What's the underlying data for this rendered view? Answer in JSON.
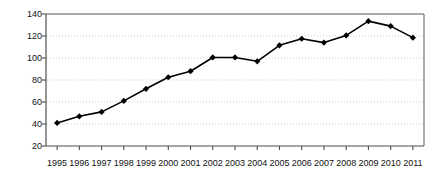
{
  "chart_data": {
    "type": "line",
    "title": "",
    "subtitle": "",
    "xlabel": "",
    "ylabel": "2002 = 100",
    "categories": [
      "1995",
      "1996",
      "1997",
      "1998",
      "1999",
      "2000",
      "2001",
      "2002",
      "2003",
      "2004",
      "2005",
      "2006",
      "2007",
      "2008",
      "2009",
      "2010",
      "2011"
    ],
    "values": [
      41,
      47,
      51,
      61,
      72,
      82.5,
      88,
      100.5,
      100.5,
      97,
      111.5,
      117.5,
      114,
      120.5,
      133.5,
      129,
      118.5
    ],
    "series": [
      {
        "name": "Index (2002 = 100)",
        "values": [
          41,
          47,
          51,
          61,
          72,
          82.5,
          88,
          100.5,
          100.5,
          97,
          111.5,
          117.5,
          114,
          120.5,
          133.5,
          129,
          118.5
        ]
      }
    ],
    "ylim": [
      20,
      140
    ],
    "yticks": [
      20,
      40,
      60,
      80,
      100,
      120,
      140
    ],
    "ytick_labels": [
      "20",
      "40",
      "60",
      "80",
      "100",
      "120",
      "140"
    ],
    "xtick_labels": [
      "1995",
      "1996",
      "1997",
      "1998",
      "1999",
      "2000",
      "2001",
      "2002",
      "2003",
      "2004",
      "2005",
      "2006",
      "2007",
      "2008",
      "2009",
      "2010",
      "2011"
    ],
    "grid": true,
    "grid_style": "dotted-horizontal",
    "legend": "none",
    "legend_position": "none",
    "annotations": [],
    "marker": "diamond",
    "line_color": "#000000",
    "marker_color": "#000000",
    "grid_color": "#c8c8c8",
    "axis_color": "#8c8c8c",
    "background_color": "#ffffff"
  }
}
